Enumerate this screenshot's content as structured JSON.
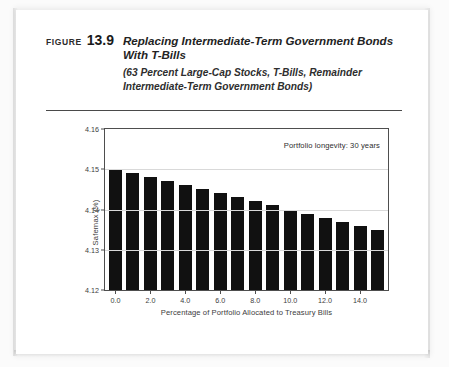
{
  "figure": {
    "label_word": "FIGURE",
    "number": "13.9",
    "title": "Replacing Intermediate-Term Government Bonds With T-Bills",
    "subtitle": "(63 Percent Large-Cap Stocks, T-Bills, Remainder Intermediate-Term Government Bonds)"
  },
  "chart_data": {
    "type": "bar",
    "title": "",
    "xlabel": "Percentage of Portfolio Allocated to Treasury Bills",
    "ylabel": "Safemax (%)",
    "annotation": "Portfolio longevity: 30 years",
    "xlim": [
      -0.6,
      15.6
    ],
    "ylim": [
      4.12,
      4.16
    ],
    "ytick_labels": [
      "4.12",
      "4.13",
      "4.14",
      "4.15",
      "4.16"
    ],
    "yticks": [
      4.12,
      4.13,
      4.14,
      4.15,
      4.16
    ],
    "xtick_labels": [
      "0.0",
      "2.0",
      "4.0",
      "6.0",
      "8.0",
      "10.0",
      "12.0",
      "14.0"
    ],
    "xticks": [
      0,
      2,
      4,
      6,
      8,
      10,
      12,
      14
    ],
    "grid": true,
    "legend": "none",
    "bar_color": "#111111",
    "categories": [
      0,
      1,
      2,
      3,
      4,
      5,
      6,
      7,
      8,
      9,
      10,
      11,
      12,
      13,
      14,
      15
    ],
    "values": [
      4.15,
      4.149,
      4.148,
      4.147,
      4.146,
      4.145,
      4.144,
      4.143,
      4.142,
      4.141,
      4.14,
      4.139,
      4.138,
      4.137,
      4.136,
      4.135
    ]
  }
}
